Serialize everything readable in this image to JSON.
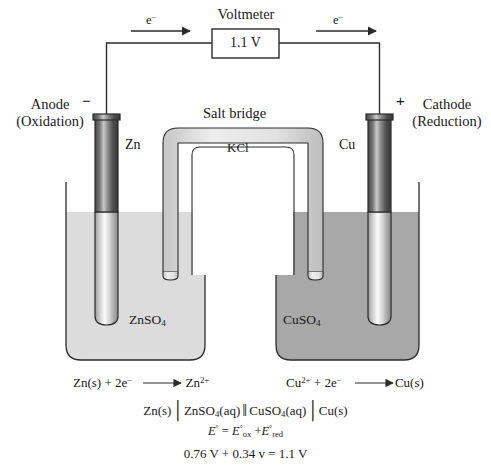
{
  "diagram": {
    "voltmeter_label": "Voltmeter",
    "voltmeter_reading": "1.1 V",
    "electron_label_left": "e",
    "electron_label_right": "e",
    "electron_charge": "−",
    "anode_line1": "Anode",
    "anode_line2": "(Oxidation)",
    "cathode_line1": "Cathode",
    "cathode_line2": "(Reduction)",
    "anode_sign": "−",
    "cathode_sign": "+",
    "electrode_left": "Zn",
    "electrode_right": "Cu",
    "salt_bridge_label": "Salt bridge",
    "salt_bridge_electrolyte": "KCl",
    "solution_left": "ZnSO",
    "solution_left_sub": "4",
    "solution_right": "CuSO",
    "solution_right_sub": "4"
  },
  "equations": {
    "half_left": {
      "reactant": "Zn(s) + 2e",
      "reactant_sup": "−",
      "arrow": "⟶",
      "product": "Zn",
      "product_sup": "2+"
    },
    "half_right": {
      "reactant": "Cu",
      "reactant_sup": "2+",
      "reactant_rest": " + 2e",
      "reactant_rest_sup": "−",
      "arrow": "⟶",
      "product": "Cu(s)"
    },
    "cell_notation": {
      "anode_metal": "Zn(s)",
      "sep_single_1": "│",
      "anode_solution": "ZnSO",
      "anode_solution_sub": "4",
      "anode_phase": "(aq)",
      "sep_double": "‖",
      "cathode_solution": "CuSO",
      "cathode_solution_sub": "4",
      "cathode_phase": "(aq)",
      "sep_single_2": "│",
      "cathode_metal": "Cu(s)"
    },
    "potential_formula": {
      "lhs": "E",
      "lhs_deg": "°",
      "eq": "=",
      "term1": "E",
      "term1_deg": "°",
      "term1_sub": "ox",
      "plus": "+",
      "term2": "E",
      "term2_deg": "°",
      "term2_sub": "red"
    },
    "potential_values": "0.76 V + 0.34 v = 1.1 V"
  },
  "colors": {
    "stroke": "#2b2b2b",
    "solution_left": "#dcdcdc",
    "solution_right": "#a8a8a8",
    "electrode_dark": "#3d3d3d",
    "electrode_light": "#f2f2f2",
    "tube_fill": "#e8e8e8",
    "background": "#ffffff"
  }
}
